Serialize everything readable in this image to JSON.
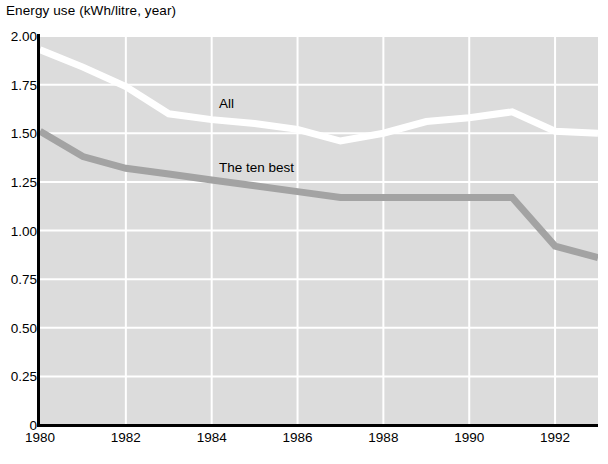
{
  "chart_data": {
    "type": "line",
    "title": "Energy use (kWh/litre, year)",
    "xlabel": "",
    "ylabel": "Energy use (kWh/litre, year)",
    "xlim": [
      1980,
      1993
    ],
    "ylim": [
      0,
      2.0
    ],
    "xticks": [
      1980,
      1982,
      1984,
      1986,
      1988,
      1990,
      1992
    ],
    "xtick_labels": [
      "1980",
      "1982",
      "1984",
      "1986",
      "1988",
      "1990",
      "1992"
    ],
    "yticks": [
      0,
      0.25,
      0.5,
      0.75,
      1.0,
      1.25,
      1.5,
      1.75,
      2.0
    ],
    "ytick_labels": [
      "0",
      "0.25",
      "0.50",
      "0.75",
      "1.00",
      "1.25",
      "1.50",
      "1.75",
      "2.00"
    ],
    "grid": "vertical-and-horizontal",
    "grid_color": "#ffffff",
    "plot_background": "#dcdcdc",
    "legend_position": "inline-labels",
    "x": [
      1980,
      1981,
      1982,
      1983,
      1984,
      1985,
      1986,
      1987,
      1988,
      1989,
      1990,
      1991,
      1992,
      1993
    ],
    "series": [
      {
        "name": "All",
        "color": "#ffffff",
        "label_text": "All",
        "values": [
          1.93,
          1.84,
          1.74,
          1.6,
          1.57,
          1.55,
          1.52,
          1.46,
          1.5,
          1.56,
          1.58,
          1.61,
          1.51,
          1.5
        ]
      },
      {
        "name": "The ten best",
        "color": "#a3a3a3",
        "label_text": "The ten best",
        "values": [
          1.51,
          1.38,
          1.32,
          1.29,
          1.26,
          1.23,
          1.2,
          1.17,
          1.17,
          1.17,
          1.17,
          1.17,
          0.92,
          0.86
        ]
      }
    ]
  },
  "annotations": {
    "series_label_all": "All",
    "series_label_ten_best": "The ten best"
  }
}
